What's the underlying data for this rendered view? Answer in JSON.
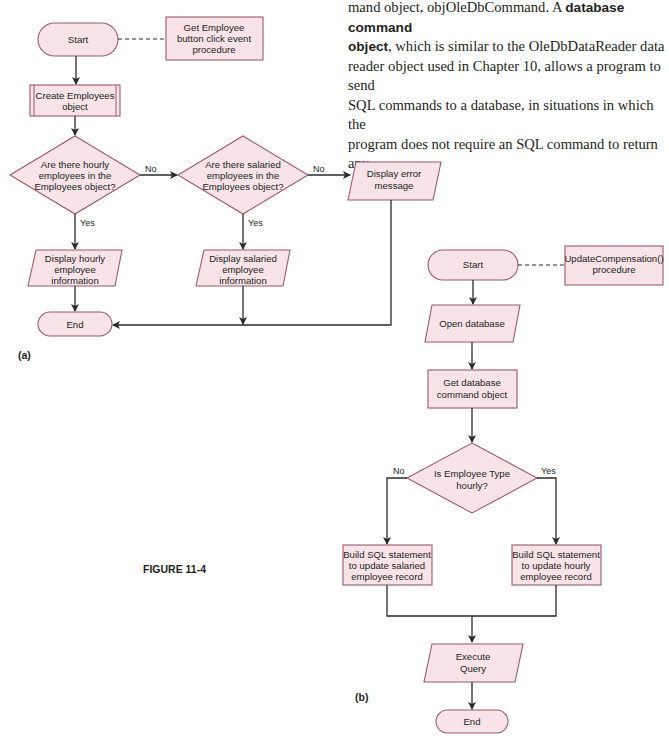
{
  "paragraph": {
    "line1_pre": "mand object, objOleDbCommand. A ",
    "line1_bold": "database command",
    "line2_bold": "object",
    "line2_rest": ", which is similar to the OleDbDataReader data",
    "line3": "reader object used in Chapter 10, allows a program to send",
    "line4": "SQL commands to a database, in situations in which the",
    "line5": "program does not require an SQL command to return any"
  },
  "figure": {
    "caption": "FIGURE 11-4",
    "shape_fill": "#f7e3e8",
    "shape_stroke": "#9c5a6e",
    "part_a": {
      "label": "(a)",
      "start": "Start",
      "note": [
        "Get Employee",
        "button click event",
        "procedure"
      ],
      "create": [
        "Create Employees",
        "object"
      ],
      "decision1": [
        "Are there hourly",
        "employees in the",
        "Employees object?"
      ],
      "decision2": [
        "Are there salaried",
        "employees in the",
        "Employees object?"
      ],
      "no1": "No",
      "no2": "No",
      "yes1": "Yes",
      "yes2": "Yes",
      "error": [
        "Display error",
        "message"
      ],
      "hourly": [
        "Display hourly",
        "employee",
        "information"
      ],
      "salaried": [
        "Display salaried",
        "employee",
        "information"
      ],
      "end": "End"
    },
    "part_b": {
      "label": "(b)",
      "start": "Start",
      "note": [
        "UpdateCompensation()",
        "procedure"
      ],
      "open": "Open database",
      "getcmd": [
        "Get database",
        "command object"
      ],
      "decision": [
        "Is Employee Type",
        "hourly?"
      ],
      "no": "No",
      "yes": "Yes",
      "build_salaried": [
        "Build SQL statement",
        "to update salaried",
        "employee record"
      ],
      "build_hourly": [
        "Build SQL statement",
        "to update hourly",
        "employee record"
      ],
      "execute": [
        "Execute",
        "Query"
      ],
      "end": "End"
    }
  }
}
